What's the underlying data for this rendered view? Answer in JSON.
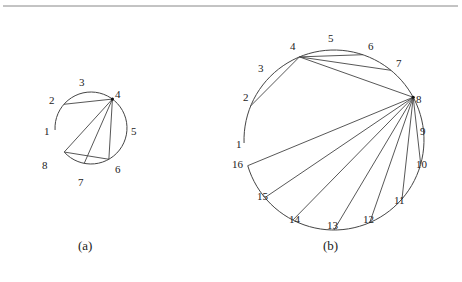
{
  "figure": {
    "top_rule": true,
    "panels": [
      {
        "id": "a",
        "caption": "(a)",
        "circle": {
          "cx": 91,
          "cy": 128,
          "r": 36
        },
        "arc": {
          "from_label": "1",
          "to_label": "8",
          "direction": "clockwise"
        },
        "points": [
          {
            "label": "1",
            "x": 55,
            "y": 130,
            "lx": 44,
            "ly": 135
          },
          {
            "label": "2",
            "x": 59,
            "y": 100,
            "lx": 49,
            "ly": 104
          },
          {
            "label": "3",
            "x": 86,
            "y": 92,
            "lx": 79,
            "ly": 86
          },
          {
            "label": "4",
            "x": 111,
            "y": 101,
            "lx": 115,
            "ly": 98
          },
          {
            "label": "5",
            "x": 127,
            "y": 130,
            "lx": 131,
            "ly": 135
          },
          {
            "label": "6",
            "x": 111,
            "y": 163,
            "lx": 115,
            "ly": 173
          },
          {
            "label": "7",
            "x": 82,
            "y": 175,
            "lx": 78,
            "ly": 186
          },
          {
            "label": "8",
            "x": 52,
            "y": 163,
            "lx": 42,
            "ly": 169
          }
        ],
        "chords": [
          [
            "2",
            "4"
          ],
          [
            "4",
            "8"
          ],
          [
            "4",
            "7"
          ],
          [
            "4",
            "6"
          ],
          [
            "8",
            "6"
          ]
        ]
      },
      {
        "id": "b",
        "caption": "(b)",
        "circle": {
          "cx": 334,
          "cy": 140,
          "r": 90
        },
        "arc": {
          "from_label": "1",
          "to_label": "16",
          "direction": "clockwise"
        },
        "points": [
          {
            "label": "1",
            "x": 244,
            "y": 143,
            "lx": 236,
            "ly": 148
          },
          {
            "label": "2",
            "x": 251,
            "y": 106,
            "lx": 243,
            "ly": 101
          },
          {
            "label": "3",
            "x": 263,
            "y": 79,
            "lx": 258,
            "ly": 72
          },
          {
            "label": "4",
            "x": 297,
            "y": 51,
            "lx": 290,
            "ly": 50
          },
          {
            "label": "5",
            "x": 330,
            "y": 44,
            "lx": 328,
            "ly": 42
          },
          {
            "label": "6",
            "x": 364,
            "y": 51,
            "lx": 368,
            "ly": 50
          },
          {
            "label": "7",
            "x": 392,
            "y": 69,
            "lx": 396,
            "ly": 67
          },
          {
            "label": "8",
            "x": 410,
            "y": 99,
            "lx": 416,
            "ly": 103
          },
          {
            "label": "9",
            "x": 418,
            "y": 128,
            "lx": 420,
            "ly": 135
          },
          {
            "label": "10",
            "x": 413,
            "y": 162,
            "lx": 416,
            "ly": 168
          },
          {
            "label": "11",
            "x": 394,
            "y": 192,
            "lx": 394,
            "ly": 204
          },
          {
            "label": "12",
            "x": 366,
            "y": 214,
            "lx": 363,
            "ly": 223
          },
          {
            "label": "13",
            "x": 334,
            "y": 219,
            "lx": 327,
            "ly": 229
          },
          {
            "label": "14",
            "x": 297,
            "y": 212,
            "lx": 289,
            "ly": 223
          },
          {
            "label": "15",
            "x": 268,
            "y": 195,
            "lx": 257,
            "ly": 200
          },
          {
            "label": "16",
            "x": 250,
            "y": 165,
            "lx": 232,
            "ly": 168
          }
        ],
        "chords": [
          [
            "2",
            "4"
          ],
          [
            "4",
            "6"
          ],
          [
            "4",
            "7"
          ],
          [
            "4",
            "8"
          ],
          [
            "8",
            "10"
          ],
          [
            "8",
            "11"
          ],
          [
            "8",
            "12"
          ],
          [
            "8",
            "13"
          ],
          [
            "8",
            "14"
          ],
          [
            "8",
            "15"
          ],
          [
            "8",
            "16"
          ]
        ]
      }
    ]
  }
}
